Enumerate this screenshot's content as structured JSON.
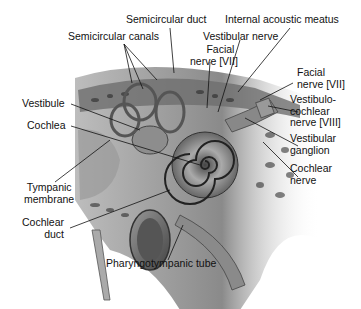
{
  "diagram": {
    "labels": {
      "semicircular_duct": "Semicircular duct",
      "internal_acoustic_meatus": "Internal acoustic meatus",
      "semicircular_canals": "Semicircular canals",
      "vestibular_nerve": "Vestibular nerve",
      "facial_nerve_top_1": "Facial",
      "facial_nerve_top_2": "nerve [VII]",
      "facial_nerve_right_1": "Facial",
      "facial_nerve_right_2": "nerve [VII]",
      "vestibulocochlear_1": "Vestibulo-",
      "vestibulocochlear_2": "cochlear",
      "vestibulocochlear_3": "nerve [VIII]",
      "vestibular_ganglion_1": "Vestibular",
      "vestibular_ganglion_2": "ganglion",
      "cochlear_nerve_1": "Cochlear",
      "cochlear_nerve_2": "nerve",
      "vestibule": "Vestibule",
      "cochlea": "Cochlea",
      "tympanic_membrane_1": "Tympanic",
      "tympanic_membrane_2": "membrane",
      "cochlear_duct_1": "Cochlear",
      "cochlear_duct_2": "duct",
      "pharyngotympanic_tube": "Pharyngotympanic tube"
    }
  }
}
